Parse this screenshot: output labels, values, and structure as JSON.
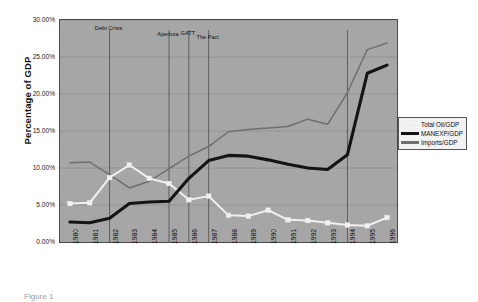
{
  "chart_data": {
    "type": "line",
    "title": "",
    "xlabel": "",
    "ylabel": "Percentage of GDP",
    "ylim": [
      0,
      30
    ],
    "ytick_labels": [
      "0.00%",
      "5.00%",
      "10.00%",
      "15.00%",
      "20.00%",
      "25.00%",
      "30.00%"
    ],
    "ytick_values": [
      0,
      5,
      10,
      15,
      20,
      25,
      30
    ],
    "grid": true,
    "legend_position": "right",
    "categories": [
      "1980",
      "1981",
      "1982",
      "1983",
      "1984",
      "1985",
      "1986",
      "1987",
      "1988",
      "1989",
      "1990",
      "1991",
      "1992",
      "1993",
      "1994",
      "1995",
      "1996"
    ],
    "series": [
      {
        "name": "Total Oil/GDP",
        "color": "#f0f0f0",
        "marker": "square",
        "values": [
          5.2,
          5.3,
          8.7,
          10.4,
          8.6,
          7.9,
          5.7,
          6.2,
          3.6,
          3.5,
          4.3,
          3.0,
          2.9,
          2.6,
          2.3,
          2.2,
          3.3
        ]
      },
      {
        "name": "MANEXP/GDP",
        "color": "#141414",
        "marker": "none",
        "values": [
          2.7,
          2.6,
          3.2,
          5.2,
          5.4,
          5.5,
          8.6,
          11.0,
          11.7,
          11.6,
          11.1,
          10.5,
          10.0,
          9.8,
          11.8,
          22.8,
          23.9
        ]
      },
      {
        "name": "Imports/GDP",
        "color": "#6f6f6f",
        "marker": "none",
        "values": [
          10.7,
          10.8,
          9.1,
          7.3,
          8.2,
          9.9,
          11.6,
          12.9,
          14.9,
          15.2,
          15.4,
          15.6,
          16.6,
          15.9,
          20.2,
          26.0,
          26.9
        ]
      }
    ],
    "annotations": [
      {
        "label": "Debt Crisis",
        "x_category": "1982",
        "line": true
      },
      {
        "label": "Apertura",
        "x_category": "1985",
        "line": true
      },
      {
        "label": "GATT",
        "x_category": "1986",
        "line": true
      },
      {
        "label": "The Pact",
        "x_category": "1987",
        "line": true
      },
      {
        "label": "",
        "x_category": "1994",
        "line": true
      }
    ],
    "plot_background": "#a6a6a6"
  },
  "legend": {
    "items": [
      {
        "label": "Total Oil/GDP"
      },
      {
        "label": "MANEXP/GDP"
      },
      {
        "label": "Imports/GDP"
      }
    ]
  },
  "caption": {
    "text": "Figure 1"
  }
}
